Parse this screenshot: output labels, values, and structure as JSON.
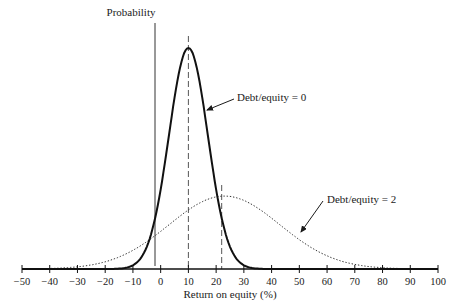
{
  "chart_data": {
    "type": "line",
    "title": "",
    "xlabel": "Return on equity (%)",
    "ylabel": "Probability",
    "xlim": [
      -50,
      100
    ],
    "ylim": [
      0,
      1
    ],
    "grid": false,
    "legend": "none (inline annotations)",
    "x_ticks": [
      -50,
      -40,
      -30,
      -20,
      -10,
      0,
      10,
      20,
      30,
      40,
      50,
      60,
      70,
      80,
      90,
      100
    ],
    "x_tick_labels": [
      "−50",
      "−40",
      "−30",
      "−20",
      "−10",
      "0",
      "10",
      "20",
      "30",
      "40",
      "50",
      "60",
      "70",
      "80",
      "90",
      "100"
    ],
    "y_axis_position_x": -2,
    "series": [
      {
        "name": "Debt/equity = 0",
        "style": "solid-bold",
        "distribution": "normal",
        "mean": 10,
        "std": 7,
        "peak_relative": 1.0,
        "x": [
          -15,
          -10,
          -5,
          0,
          5,
          10,
          15,
          20,
          25,
          30,
          35
        ],
        "values": [
          0.0,
          0.06,
          0.18,
          0.36,
          0.77,
          1.0,
          0.77,
          0.36,
          0.1,
          0.02,
          0.0
        ]
      },
      {
        "name": "Debt/equity = 2",
        "style": "dotted",
        "distribution": "normal",
        "mean": 23,
        "std": 20,
        "peak_relative": 0.33,
        "x": [
          -40,
          -30,
          -20,
          -10,
          0,
          10,
          20,
          30,
          40,
          50,
          60,
          70,
          80,
          90
        ],
        "values": [
          0.0,
          0.01,
          0.03,
          0.08,
          0.16,
          0.27,
          0.33,
          0.31,
          0.23,
          0.13,
          0.06,
          0.02,
          0.0,
          0.0
        ]
      }
    ],
    "reference_lines": [
      {
        "x": 10,
        "style": "dashed",
        "label": "mean, Debt/equity = 0"
      },
      {
        "x": 22,
        "style": "dashed",
        "label": "mean, Debt/equity = 2"
      }
    ],
    "annotations": [
      {
        "text": "Debt/equity = 0",
        "points_to_series": 0
      },
      {
        "text": "Debt/equity = 2",
        "points_to_series": 1
      }
    ]
  },
  "labels": {
    "y_axis": "Probability",
    "x_axis": "Return on equity (%)",
    "annot_de0": "Debt/equity = 0",
    "annot_de2": "Debt/equity = 2"
  }
}
